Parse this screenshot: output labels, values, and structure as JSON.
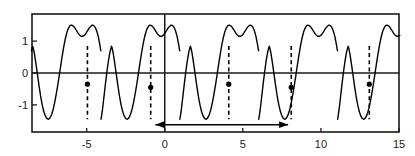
{
  "chart_data": {
    "type": "line",
    "title": "",
    "subtitle": "",
    "xlabel": "",
    "ylabel": "",
    "xlim": [
      -8.5,
      15
    ],
    "ylim": [
      -1.85,
      1.85
    ],
    "grid": false,
    "legend": null,
    "xticks": [
      -5,
      0,
      5,
      10,
      15
    ],
    "xtick_labels": [
      "-5",
      "0",
      "5",
      "10",
      "15"
    ],
    "yticks": [
      -1,
      0,
      1
    ],
    "ytick_labels": [
      "-1",
      "0",
      "1"
    ],
    "series": [
      {
        "name": "waveform",
        "color": "#000000",
        "linewidth": 1.4,
        "period": 5.05,
        "phase_offset": 0.0,
        "jump_x": [
          -9.1,
          -4.05,
          1.0,
          6.05,
          11.1
        ],
        "jump_top": 0.85,
        "jump_bottom": -1.45,
        "crest_peak_1": 1.5,
        "crest_dip": 1.15,
        "crest_peak_2": 1.5,
        "trough": -1.45,
        "points": [
          [
            -8.5,
            0.05
          ],
          [
            -8.4,
            0.42
          ],
          [
            -8.3,
            0.78
          ],
          [
            -8.2,
            1.06
          ],
          [
            -8.1,
            1.26
          ],
          [
            -8.0,
            1.39
          ],
          [
            -7.9,
            1.47
          ],
          [
            -7.8,
            1.5
          ],
          [
            -7.7,
            1.49
          ],
          [
            -7.6,
            1.45
          ],
          [
            -7.5,
            1.39
          ],
          [
            -7.4,
            1.32
          ],
          [
            -7.3,
            1.25
          ],
          [
            -7.2,
            1.2
          ],
          [
            -7.1,
            1.16
          ],
          [
            -7.0,
            1.15
          ],
          [
            -6.9,
            1.16
          ],
          [
            -6.8,
            1.2
          ],
          [
            -6.7,
            1.25
          ],
          [
            -6.6,
            1.32
          ],
          [
            -6.5,
            1.39
          ],
          [
            -6.4,
            1.45
          ],
          [
            -6.3,
            1.49
          ],
          [
            -6.2,
            1.5
          ],
          [
            -6.1,
            1.47
          ],
          [
            -6.0,
            1.39
          ],
          [
            -5.9,
            1.26
          ],
          [
            -5.8,
            1.06
          ],
          [
            -5.7,
            0.78
          ],
          [
            -5.6,
            0.42
          ],
          [
            -5.5,
            0.02
          ],
          [
            -5.4,
            -0.38
          ],
          [
            -5.3,
            -0.74
          ],
          [
            -5.2,
            -1.04
          ],
          [
            -5.1,
            -1.26
          ],
          [
            -5.0,
            -1.4
          ],
          [
            -4.92,
            -1.45
          ],
          [
            -4.85,
            -1.45
          ],
          [
            -4.8,
            -1.2
          ],
          [
            -4.7,
            -0.75
          ],
          [
            -4.6,
            -0.3
          ],
          [
            -4.5,
            0.1
          ],
          [
            -4.4,
            0.44
          ],
          [
            -4.3,
            0.7
          ],
          [
            -4.2,
            0.85
          ],
          [
            -4.1,
            0.6
          ],
          [
            -4.0,
            0.25
          ],
          [
            -3.9,
            -0.12
          ],
          [
            -3.8,
            -0.48
          ],
          [
            -3.7,
            -0.8
          ],
          [
            -3.6,
            -1.06
          ],
          [
            -3.5,
            -1.25
          ],
          [
            -3.4,
            -1.38
          ],
          [
            -3.3,
            -1.44
          ],
          [
            -3.2,
            -1.45
          ],
          [
            -3.1,
            -1.42
          ],
          [
            -3.0,
            -1.34
          ],
          [
            -2.9,
            -1.2
          ],
          [
            -2.8,
            -1.0
          ],
          [
            -2.7,
            -0.76
          ],
          [
            -2.6,
            -0.48
          ],
          [
            -2.5,
            -0.18
          ],
          [
            -2.4,
            0.14
          ],
          [
            -2.3,
            0.46
          ],
          [
            -2.2,
            0.76
          ],
          [
            -2.1,
            1.02
          ],
          [
            -2.0,
            1.22
          ],
          [
            -1.9,
            1.37
          ],
          [
            -1.8,
            1.46
          ],
          [
            -1.7,
            1.5
          ],
          [
            -1.6,
            1.49
          ],
          [
            -1.5,
            1.44
          ],
          [
            -1.4,
            1.37
          ],
          [
            -1.3,
            1.28
          ],
          [
            -1.2,
            1.21
          ],
          [
            -1.1,
            1.16
          ],
          [
            -1.0,
            1.15
          ],
          [
            -0.9,
            1.17
          ],
          [
            -0.8,
            1.22
          ],
          [
            -0.7,
            1.29
          ],
          [
            -0.6,
            1.37
          ],
          [
            -0.5,
            1.44
          ],
          [
            -0.4,
            1.49
          ],
          [
            -0.3,
            1.5
          ],
          [
            -0.2,
            1.46
          ],
          [
            -0.1,
            1.36
          ],
          [
            0.0,
            1.2
          ],
          [
            0.1,
            0.97
          ],
          [
            0.2,
            0.68
          ],
          [
            0.3,
            0.33
          ],
          [
            0.4,
            -0.05
          ],
          [
            0.5,
            -0.43
          ],
          [
            0.6,
            -0.78
          ],
          [
            0.7,
            -1.07
          ],
          [
            0.8,
            -1.28
          ],
          [
            0.9,
            -1.41
          ],
          [
            0.97,
            -1.45
          ],
          [
            1.05,
            -1.2
          ],
          [
            1.15,
            -0.78
          ],
          [
            1.25,
            -0.35
          ],
          [
            1.35,
            0.05
          ],
          [
            1.45,
            0.4
          ],
          [
            1.55,
            0.68
          ],
          [
            1.65,
            0.85
          ],
          [
            1.75,
            0.62
          ],
          [
            1.85,
            0.3
          ],
          [
            1.95,
            -0.05
          ],
          [
            2.05,
            -0.4
          ],
          [
            2.15,
            -0.72
          ],
          [
            2.25,
            -0.99
          ],
          [
            2.35,
            -1.2
          ],
          [
            2.45,
            -1.34
          ],
          [
            2.55,
            -1.43
          ],
          [
            2.65,
            -1.45
          ],
          [
            2.75,
            -1.41
          ],
          [
            2.85,
            -1.31
          ],
          [
            2.95,
            -1.15
          ],
          [
            3.05,
            -0.93
          ],
          [
            3.15,
            -0.67
          ],
          [
            3.25,
            -0.38
          ],
          [
            3.35,
            -0.06
          ],
          [
            3.45,
            0.27
          ],
          [
            3.55,
            0.58
          ],
          [
            3.65,
            0.87
          ],
          [
            3.75,
            1.11
          ],
          [
            3.85,
            1.3
          ],
          [
            3.95,
            1.42
          ],
          [
            4.05,
            1.49
          ],
          [
            4.15,
            1.5
          ],
          [
            4.25,
            1.47
          ],
          [
            4.35,
            1.41
          ],
          [
            4.45,
            1.33
          ],
          [
            4.55,
            1.25
          ],
          [
            4.65,
            1.19
          ],
          [
            4.75,
            1.15
          ],
          [
            4.85,
            1.15
          ],
          [
            4.95,
            1.18
          ],
          [
            5.05,
            1.24
          ],
          [
            5.15,
            1.32
          ],
          [
            5.25,
            1.4
          ],
          [
            5.35,
            1.46
          ],
          [
            5.45,
            1.5
          ],
          [
            5.55,
            1.49
          ],
          [
            5.65,
            1.43
          ],
          [
            5.75,
            1.31
          ],
          [
            5.85,
            1.13
          ],
          [
            5.95,
            0.87
          ],
          [
            6.0,
            0.7
          ]
        ]
      }
    ],
    "discontinuity_markers": [
      {
        "x": -4.95,
        "y": -0.35,
        "dash_from": 0.85,
        "dash_to": -1.45
      },
      {
        "x": -0.9,
        "y": -0.45,
        "dash_from": 0.85,
        "dash_to": -1.45
      },
      {
        "x": 4.1,
        "y": -0.35,
        "dash_from": 0.85,
        "dash_to": -1.45
      },
      {
        "x": 8.1,
        "y": -0.45,
        "dash_from": 0.85,
        "dash_to": -1.45
      },
      {
        "x": 13.1,
        "y": -0.35,
        "dash_from": 0.85,
        "dash_to": -1.45
      }
    ],
    "period_arrow": {
      "x_start": -0.6,
      "x_end": 7.9,
      "y": -1.62,
      "double_headed": true,
      "label": ""
    },
    "axis_lines": {
      "zero_horizontal": 0,
      "zero_vertical": 0
    }
  }
}
